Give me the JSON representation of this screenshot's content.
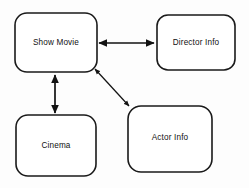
{
  "diagram": {
    "background_color": "#fdfdfd",
    "stroke_color": "#1a1a1a",
    "nodes": [
      {
        "id": "show-movie",
        "label": "Show Movie",
        "x": 15,
        "y": 13,
        "width": 82,
        "height": 59,
        "radius": 12,
        "label_x": 56,
        "label_y": 43
      },
      {
        "id": "director-info",
        "label": "Director Info",
        "x": 157,
        "y": 15,
        "width": 78,
        "height": 55,
        "radius": 11,
        "label_x": 196,
        "label_y": 43
      },
      {
        "id": "cinema",
        "label": "Cinema",
        "x": 16,
        "y": 115,
        "width": 80,
        "height": 61,
        "radius": 12,
        "label_x": 56,
        "label_y": 146
      },
      {
        "id": "actor-info",
        "label": "Actor Info",
        "x": 128,
        "y": 106,
        "width": 84,
        "height": 66,
        "radius": 13,
        "label_x": 170,
        "label_y": 138
      }
    ],
    "edges": [
      {
        "id": "show-movie-director-info",
        "from": "show-movie",
        "to": "director-info",
        "orientation": "horizontal",
        "arrowheads": "both",
        "x1": 99,
        "y1": 43,
        "x2": 154,
        "y2": 43
      },
      {
        "id": "show-movie-cinema",
        "from": "show-movie",
        "to": "cinema",
        "orientation": "vertical",
        "arrowheads": "both",
        "x1": 55,
        "y1": 75,
        "x2": 55,
        "y2": 113
      },
      {
        "id": "show-movie-actor-info",
        "from": "show-movie",
        "to": "actor-info",
        "orientation": "diagonal",
        "arrowheads": "both",
        "x1": 95,
        "y1": 69,
        "x2": 129,
        "y2": 106
      }
    ]
  }
}
